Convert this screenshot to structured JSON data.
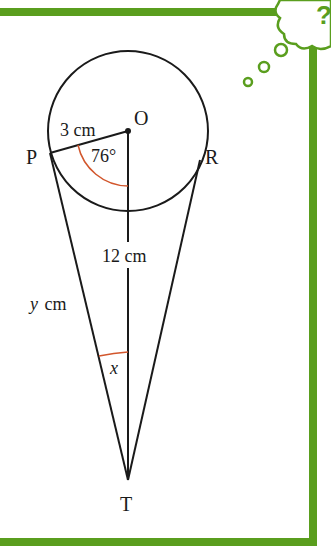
{
  "colors": {
    "frame": "#5a9e1e",
    "line": "#1a1a1a",
    "angle_arc": "#d2562c",
    "background": "#ffffff"
  },
  "diagram": {
    "points": {
      "O": "O",
      "P": "P",
      "R": "R",
      "T": "T"
    },
    "labels": {
      "radius": "3 cm",
      "angle_POT": "76°",
      "OT_length": "12 cm",
      "PT_length_var": "y",
      "PT_length_unit": "cm",
      "angle_PTO": "x"
    }
  },
  "decoration": {
    "thought_bubble_symbol": "?"
  }
}
